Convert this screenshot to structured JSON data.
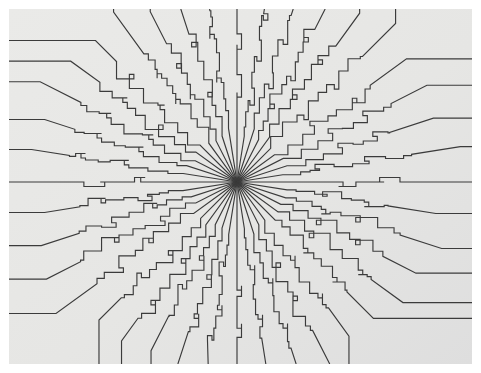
{
  "figure": {
    "kind": "radial-line-figure",
    "canvas": {
      "width": 481,
      "height": 373,
      "margin_left": 9,
      "margin_top": 9,
      "margin_right": 9,
      "margin_bottom": 9,
      "page_background": "#ffffff",
      "plot_background": "#e9e9e7",
      "plot_background_gradient_to": "#e1e1df"
    },
    "line_style": {
      "color": "#3b3b3b",
      "width": 1.15,
      "cap": "butt",
      "join": "miter"
    },
    "center": {
      "x": 237,
      "y": 182
    },
    "ray_count": 40,
    "inner_straight_radius": 46,
    "step_zone_outer_radius": 150,
    "step_size": 13,
    "notch_size": 5
  },
  "chart_data": {
    "type": "line",
    "xlabel": "",
    "ylabel": "",
    "xlim": [
      0,
      481
    ],
    "ylim": [
      0,
      373
    ],
    "grid": false,
    "legend": null,
    "center": [
      237,
      182
    ],
    "series_count": 40,
    "angles_deg": [
      0,
      9,
      18,
      27,
      36,
      45,
      54,
      63,
      72,
      81,
      90,
      99,
      108,
      117,
      126,
      135,
      144,
      153,
      162,
      171,
      180,
      189,
      198,
      207,
      216,
      225,
      234,
      243,
      252,
      261,
      270,
      279,
      288,
      297,
      306,
      315,
      324,
      333,
      342,
      351
    ],
    "edge_intercepts": {
      "left_y": [
        14,
        27,
        52,
        79,
        110,
        141,
        180,
        215,
        250,
        283,
        315,
        337,
        355
      ],
      "right_y": [
        15,
        35,
        56,
        85,
        118,
        155,
        190,
        228,
        262,
        295,
        320,
        342,
        358
      ],
      "top_x": [
        195,
        228,
        262,
        300
      ],
      "bottom_x": [
        178,
        212,
        248,
        282
      ]
    }
  }
}
